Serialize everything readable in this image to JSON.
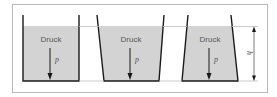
{
  "diagram": {
    "containers": [
      {
        "id": "container-1",
        "shape": "straight",
        "label": "Druck",
        "symbol": "p"
      },
      {
        "id": "container-2",
        "shape": "widening",
        "label": "Druck",
        "symbol": "p"
      },
      {
        "id": "container-3",
        "shape": "narrowing",
        "label": "Druck",
        "symbol": "p"
      }
    ],
    "dimension": {
      "label": "h"
    },
    "colors": {
      "liquid": "#d3d3d3",
      "wall": "#1a1a1a",
      "frame": "#b0b0b0",
      "guide_line": "#bdbdbd",
      "text": "#555555"
    }
  }
}
